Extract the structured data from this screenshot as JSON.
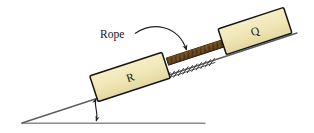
{
  "figure": {
    "type": "physics-free-body-diagram",
    "labels": {
      "rope": "Rope",
      "block_lower": "R",
      "block_upper": "Q"
    },
    "colors": {
      "block_fill": "#efe5b4",
      "block_stroke": "#1a1a1a",
      "rope_fill": "#6b4a21",
      "rope_stroke": "#3d2a10",
      "line": "#58585a",
      "ground_line": "#8c8c8e",
      "text": "#1a1a1a",
      "background": "#ffffff"
    },
    "geometry": {
      "incline_angle_degrees": 18,
      "incline_start": [
        22,
        123
      ],
      "incline_end": [
        297,
        33
      ],
      "ground_start": [
        22,
        123
      ],
      "ground_end": [
        205,
        123
      ],
      "angle_marker_x": 96,
      "angle_marker_top_y": 98,
      "angle_marker_bottom_y": 122
    },
    "blocks": [
      {
        "name": "R",
        "label": "R",
        "center": [
          130,
          77
        ],
        "width": 76,
        "height": 27,
        "rotation_degrees": -18
      },
      {
        "name": "Q",
        "label": "Q",
        "center": [
          255,
          31
        ],
        "width": 69,
        "height": 27,
        "rotation_degrees": -18
      }
    ],
    "rope": {
      "label": "Rope",
      "from": [
        168,
        62
      ],
      "to": [
        224,
        43
      ],
      "thickness": 6,
      "texture": "cross-hatched-strands"
    },
    "callout": {
      "label": "Rope",
      "text_position": [
        100,
        36
      ],
      "arrow_from": [
        137,
        31
      ],
      "arrow_to": [
        187,
        55
      ],
      "style": "curved-arrow"
    },
    "hatching": {
      "name": "ground-surface-hatching",
      "count": 11,
      "x_start": 168,
      "x_end": 212,
      "stroke_length": 9
    }
  }
}
